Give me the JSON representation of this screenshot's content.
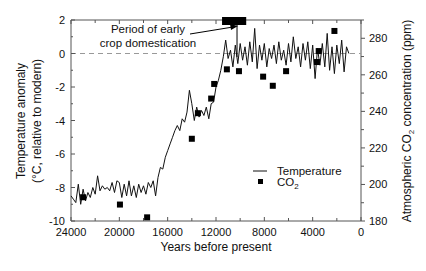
{
  "chart_data": {
    "type": "line",
    "title": "",
    "xlabel": "Years before present",
    "ylabel": "Temperature anomaly (°C, relative to modern)",
    "ylabel_line1": "Temperature anomaly",
    "ylabel_line2": "(°C, relative to modern)",
    "y2label": "Atmospheric CO2 concentration (ppm)",
    "y2label_prefix": "Atmospheric CO",
    "y2label_sub": "2",
    "y2label_suffix": " concentration (ppm)",
    "xlim": [
      24000,
      0
    ],
    "ylim": [
      -10,
      2
    ],
    "y2lim": [
      180,
      290
    ],
    "x_ticks": [
      24000,
      20000,
      16000,
      12000,
      8000,
      4000,
      0
    ],
    "x_tick_labels": [
      "24000",
      "20000",
      "16000",
      "12000",
      "8000",
      "4000",
      "0"
    ],
    "y_ticks": [
      2,
      0,
      -2,
      -4,
      -6,
      -8,
      -10
    ],
    "y_tick_labels": [
      "2",
      "0",
      "-2",
      "-4",
      "-6",
      "-8",
      "-10"
    ],
    "y2_ticks": [
      280,
      260,
      240,
      220,
      200,
      180
    ],
    "y2_tick_labels": [
      "280",
      "260",
      "240",
      "220",
      "200",
      "180"
    ],
    "reference_line": {
      "y": 0,
      "style": "dashed"
    },
    "annotation": {
      "line1": "Period of early",
      "line2": "crop domestication",
      "bar_years": [
        11500,
        9500
      ]
    },
    "legend": {
      "entries": [
        "Temperature",
        "CO2"
      ],
      "temperature_label": "Temperature",
      "co2_label_main": "CO",
      "co2_label_sub": "2",
      "position": "lower right"
    },
    "series": [
      {
        "name": "Temperature",
        "axis": "left",
        "style": "line",
        "x": [
          24000,
          23800,
          23600,
          23400,
          23200,
          23000,
          22800,
          22600,
          22400,
          22200,
          22000,
          21800,
          21600,
          21400,
          21200,
          21000,
          20800,
          20600,
          20400,
          20200,
          20000,
          19800,
          19600,
          19400,
          19200,
          19000,
          18800,
          18600,
          18400,
          18200,
          18000,
          17800,
          17600,
          17400,
          17200,
          17000,
          16800,
          16600,
          16400,
          16200,
          16000,
          15800,
          15600,
          15400,
          15200,
          15000,
          14800,
          14600,
          14400,
          14200,
          14000,
          13800,
          13600,
          13400,
          13200,
          13000,
          12800,
          12600,
          12400,
          12200,
          12000,
          11800,
          11600,
          11400,
          11200,
          11000,
          10800,
          10600,
          10400,
          10200,
          10000,
          9800,
          9600,
          9400,
          9200,
          9000,
          8800,
          8600,
          8400,
          8200,
          8000,
          7800,
          7600,
          7400,
          7200,
          7000,
          6800,
          6600,
          6400,
          6200,
          6000,
          5800,
          5600,
          5400,
          5200,
          5000,
          4800,
          4600,
          4400,
          4200,
          4000,
          3800,
          3600,
          3400,
          3200,
          3000,
          2800,
          2600,
          2400,
          2200,
          2000,
          1800,
          1600,
          1400,
          1200,
          1000
        ],
        "values": [
          -8.5,
          -8.7,
          -8.9,
          -7.8,
          -9.0,
          -8.1,
          -8.8,
          -8.3,
          -8.6,
          -8.0,
          -8.4,
          -7.3,
          -8.2,
          -7.9,
          -8.1,
          -8.0,
          -8.2,
          -7.7,
          -8.3,
          -7.6,
          -7.7,
          -8.6,
          -7.8,
          -8.5,
          -7.6,
          -8.5,
          -7.9,
          -8.6,
          -7.8,
          -8.3,
          -7.9,
          -8.4,
          -7.7,
          -8.0,
          -7.6,
          -8.5,
          -7.4,
          -6.8,
          -6.9,
          -6.2,
          -5.8,
          -5.4,
          -5.0,
          -4.6,
          -4.3,
          -4.6,
          -3.9,
          -4.1,
          -3.5,
          -2.2,
          -3.0,
          -4.0,
          -3.2,
          -3.8,
          -3.4,
          -3.7,
          -3.2,
          -3.9,
          -3.0,
          -2.9,
          -2.0,
          -1.6,
          -1.0,
          -0.2,
          0.8,
          -0.3,
          0.2,
          -0.8,
          0.5,
          -0.6,
          0.6,
          -0.4,
          0.4,
          -0.7,
          0.7,
          -0.5,
          1.5,
          -0.9,
          0.5,
          -0.4,
          0.6,
          -0.8,
          0.3,
          -0.3,
          0.5,
          -0.6,
          0.7,
          -0.4,
          0.2,
          -0.7,
          0.6,
          -0.5,
          1.0,
          -0.3,
          0.4,
          -0.8,
          0.6,
          -0.4,
          0.7,
          -0.9,
          0.5,
          -1.5,
          0.3,
          -0.7,
          0.6,
          -0.8,
          1.2,
          -1.0,
          0.4,
          -1.2,
          0.5,
          -0.6,
          0.8,
          -1.1,
          0.4,
          0.0
        ]
      },
      {
        "name": "CO2",
        "axis": "right",
        "style": "square-markers",
        "x": [
          23000,
          19950,
          17700,
          14000,
          13500,
          12400,
          12150,
          11100,
          10100,
          8100,
          7300,
          6200,
          3650,
          3500,
          2200
        ],
        "values": [
          193,
          189,
          182,
          225,
          239,
          247,
          255,
          263,
          262,
          259,
          254,
          262,
          267,
          273,
          284
        ]
      }
    ]
  },
  "colors": {
    "line": "#111111",
    "marker": "#000000",
    "axis": "#555555",
    "dashed_ref": "#999999"
  }
}
